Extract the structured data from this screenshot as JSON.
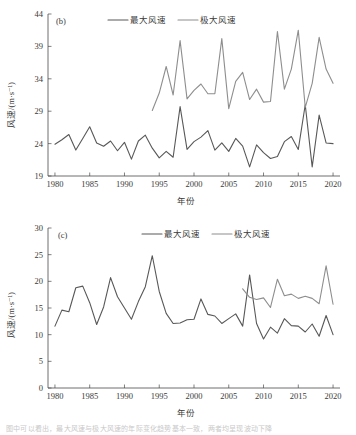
{
  "figure": {
    "background": "#ffffff",
    "caption_partial": "图中可以看出，最大风速与极大风速的年际变化趋势基本一致，两者均呈现波动下降"
  },
  "colors": {
    "max_wind": "#585858",
    "extreme_wind": "#8e8e8e",
    "axis": "#4a4a4a",
    "text": "#3a3a3a"
  },
  "legend": {
    "series1_label": "最大风速",
    "series2_label": "极大风速"
  },
  "panels": [
    {
      "tag": "(b)",
      "xlabel": "年份",
      "ylabel": "风速/(m·s⁻¹)",
      "xticks": [
        "1980",
        "1985",
        "1990",
        "1995",
        "2000",
        "2005",
        "2010",
        "2015",
        "2020"
      ],
      "yticks": [
        "19",
        "24",
        "29",
        "34",
        "39",
        "44"
      ]
    },
    {
      "tag": "(c)",
      "xlabel": "年份",
      "ylabel": "风速/(m·s⁻¹)",
      "xticks": [
        "1980",
        "1985",
        "1990",
        "1995",
        "2000",
        "2005",
        "2010",
        "2015",
        "2020"
      ],
      "yticks": [
        "0",
        "5",
        "10",
        "15",
        "20",
        "25",
        "30"
      ]
    }
  ],
  "chart_data": [
    {
      "type": "line",
      "title": "(b)",
      "xlabel": "年份",
      "ylabel": "风速/(m·s⁻¹)",
      "xlim": [
        1979,
        2021
      ],
      "ylim": [
        19,
        44
      ],
      "xticks": [
        1980,
        1985,
        1990,
        1995,
        2000,
        2005,
        2010,
        2015,
        2020
      ],
      "yticks": [
        19,
        24,
        29,
        34,
        39,
        44
      ],
      "grid": false,
      "legend_position": "top-center",
      "series": [
        {
          "name": "最大风速",
          "color": "#585858",
          "x": [
            1980,
            1981,
            1982,
            1983,
            1984,
            1985,
            1986,
            1987,
            1988,
            1989,
            1990,
            1991,
            1992,
            1993,
            1994,
            1995,
            1996,
            1997,
            1998,
            1999,
            2000,
            2001,
            2002,
            2003,
            2004,
            2005,
            2006,
            2007,
            2008,
            2009,
            2010,
            2011,
            2012,
            2013,
            2014,
            2015,
            2016,
            2017,
            2018,
            2019,
            2020
          ],
          "values": [
            23.9,
            24.6,
            25.4,
            23.0,
            24.8,
            26.6,
            24.1,
            23.6,
            24.4,
            22.9,
            24.2,
            21.6,
            24.4,
            25.3,
            23.3,
            21.8,
            22.8,
            21.9,
            29.7,
            23.1,
            24.3,
            25.0,
            26.0,
            23.0,
            24.1,
            22.8,
            24.8,
            23.6,
            20.4,
            23.8,
            22.6,
            21.7,
            22.0,
            24.3,
            25.1,
            23.1,
            30.0,
            20.4,
            28.4,
            24.1,
            24.0
          ]
        },
        {
          "name": "极大风速",
          "color": "#8e8e8e",
          "x": [
            1994,
            1995,
            1996,
            1997,
            1998,
            1999,
            2000,
            2001,
            2002,
            2003,
            2004,
            2005,
            2006,
            2007,
            2008,
            2009,
            2010,
            2011,
            2012,
            2013,
            2014,
            2015,
            2016,
            2017,
            2018,
            2019,
            2020
          ],
          "values": [
            29.1,
            31.8,
            35.9,
            31.5,
            39.9,
            30.9,
            32.2,
            33.2,
            31.7,
            31.7,
            40.2,
            29.4,
            33.6,
            35.0,
            30.8,
            32.4,
            30.4,
            30.5,
            41.3,
            32.4,
            35.5,
            41.5,
            29.6,
            33.3,
            40.4,
            35.5,
            33.3
          ]
        }
      ]
    },
    {
      "type": "line",
      "title": "(c)",
      "xlabel": "年份",
      "ylabel": "风速/(m·s⁻¹)",
      "xlim": [
        1979,
        2021
      ],
      "ylim": [
        0,
        30
      ],
      "xticks": [
        1980,
        1985,
        1990,
        1995,
        2000,
        2005,
        2010,
        2015,
        2020
      ],
      "yticks": [
        0,
        5,
        10,
        15,
        20,
        25,
        30
      ],
      "grid": false,
      "legend_position": "top-center",
      "series": [
        {
          "name": "最大风速",
          "color": "#585858",
          "x": [
            1980,
            1981,
            1982,
            1983,
            1984,
            1985,
            1986,
            1987,
            1988,
            1989,
            1990,
            1991,
            1992,
            1993,
            1994,
            1995,
            1996,
            1997,
            1998,
            1999,
            2000,
            2001,
            2002,
            2003,
            2004,
            2005,
            2006,
            2007,
            2008,
            2009,
            2010,
            2011,
            2012,
            2013,
            2014,
            2015,
            2016,
            2017,
            2018,
            2019,
            2020
          ],
          "values": [
            11.6,
            14.6,
            14.3,
            18.8,
            19.1,
            16.0,
            11.9,
            15.2,
            20.7,
            17.1,
            15.0,
            12.9,
            16.2,
            19.0,
            24.8,
            18.1,
            14.0,
            12.1,
            12.2,
            12.8,
            12.9,
            16.7,
            13.8,
            13.5,
            12.1,
            13.0,
            13.9,
            11.6,
            21.2,
            12.1,
            9.2,
            11.4,
            10.3,
            13.0,
            11.7,
            11.6,
            10.5,
            12.0,
            9.7,
            13.6,
            10.0
          ]
        },
        {
          "name": "极大风速",
          "color": "#8e8e8e",
          "x": [
            2007,
            2008,
            2009,
            2010,
            2011,
            2012,
            2013,
            2014,
            2015,
            2016,
            2017,
            2018,
            2019,
            2020
          ],
          "values": [
            18.6,
            17.0,
            16.6,
            16.9,
            15.1,
            20.4,
            17.3,
            17.6,
            16.8,
            17.2,
            16.8,
            15.8,
            22.9,
            15.7
          ]
        }
      ]
    }
  ]
}
